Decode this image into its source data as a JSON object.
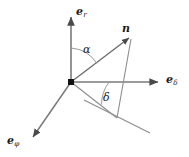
{
  "figure": {
    "name": "spherical-unit-vector-diagram",
    "background_color": "#ffffff",
    "line_color": "#6f6f6f",
    "text_color": "#1a1a1a",
    "origin_marker_color": "#000000",
    "axes": [
      {
        "id": "e-r",
        "base": "e",
        "subscript": "r",
        "direction": "up",
        "arrow": true,
        "from": [
          71,
          82
        ],
        "to": [
          71,
          14
        ]
      },
      {
        "id": "e-delta",
        "base": "e",
        "subscript": "δ",
        "direction": "right",
        "arrow": true,
        "from": [
          71,
          82
        ],
        "to": [
          161,
          82
        ]
      },
      {
        "id": "e-phi",
        "base": "e",
        "subscript": "φ",
        "direction": "down-left",
        "arrow": true,
        "from": [
          71,
          82
        ],
        "to": [
          31,
          139
        ]
      }
    ],
    "vectors": [
      {
        "id": "n",
        "label": "n",
        "bold": true,
        "arrow": true,
        "from": [
          71,
          82
        ],
        "to": [
          131,
          36
        ]
      }
    ],
    "construction_lines": [
      {
        "id": "projection-diagonal",
        "from": [
          84,
          100
        ],
        "to": [
          150,
          133
        ]
      },
      {
        "id": "vertical-drop",
        "from": [
          131,
          38
        ],
        "to": [
          117,
          118
        ]
      },
      {
        "id": "origin-to-projection",
        "from": [
          71,
          82
        ],
        "to": [
          117,
          118
        ]
      }
    ],
    "angles": [
      {
        "id": "alpha",
        "label": "α",
        "between": [
          "e-r",
          "n"
        ],
        "vertex": [
          71,
          82
        ],
        "arc_radius": 34
      },
      {
        "id": "delta",
        "label": "δ",
        "between": [
          "e-delta",
          "projection-line"
        ],
        "vertex": [
          71,
          82
        ],
        "arc_radius": 38
      }
    ],
    "origin": {
      "label": "origin-point",
      "position": [
        71,
        82
      ],
      "shape": "filled-square"
    }
  }
}
